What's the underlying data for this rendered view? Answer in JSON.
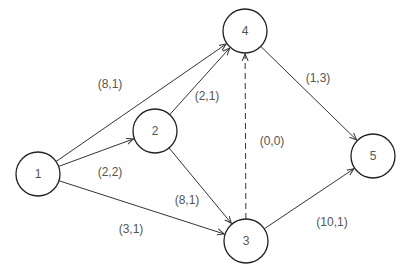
{
  "diagram": {
    "type": "directed-network",
    "nodes": [
      {
        "id": "1",
        "label": "1",
        "x": 38,
        "y": 174
      },
      {
        "id": "2",
        "label": "2",
        "x": 155,
        "y": 131
      },
      {
        "id": "3",
        "label": "3",
        "x": 246,
        "y": 241
      },
      {
        "id": "4",
        "label": "4",
        "x": 245,
        "y": 31
      },
      {
        "id": "5",
        "label": "5",
        "x": 373,
        "y": 156
      }
    ],
    "edges": [
      {
        "from": "1",
        "to": "4",
        "label": "(8,1)",
        "style": "solid",
        "lx": 110,
        "ly": 88
      },
      {
        "from": "1",
        "to": "2",
        "label": "(2,2)",
        "style": "solid",
        "lx": 110,
        "ly": 176
      },
      {
        "from": "1",
        "to": "3",
        "label": "(3,1)",
        "style": "solid",
        "lx": 131,
        "ly": 233
      },
      {
        "from": "2",
        "to": "4",
        "label": "(2,1)",
        "style": "solid",
        "lx": 207,
        "ly": 100
      },
      {
        "from": "2",
        "to": "3",
        "label": "(8,1)",
        "style": "solid",
        "lx": 187,
        "ly": 204
      },
      {
        "from": "3",
        "to": "4",
        "label": "(0,0)",
        "style": "dashed",
        "lx": 272,
        "ly": 145
      },
      {
        "from": "4",
        "to": "5",
        "label": "(1,3)",
        "style": "solid",
        "lx": 318,
        "ly": 82
      },
      {
        "from": "3",
        "to": "5",
        "label": "(10,1)",
        "style": "solid",
        "lx": 332,
        "ly": 226
      }
    ]
  }
}
